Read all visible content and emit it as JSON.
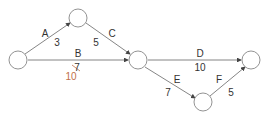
{
  "diagram": {
    "type": "activity-on-arrow network",
    "colors": {
      "line": "#666666",
      "node_stroke": "#777777",
      "correction": "#c0704a"
    },
    "activities": [
      {
        "id": "A",
        "duration": "3"
      },
      {
        "id": "B",
        "duration": "7",
        "corrected_duration": "10"
      },
      {
        "id": "C",
        "duration": "5"
      },
      {
        "id": "D",
        "duration": "10"
      },
      {
        "id": "E",
        "duration": "7"
      },
      {
        "id": "F",
        "duration": "5"
      }
    ]
  }
}
